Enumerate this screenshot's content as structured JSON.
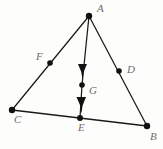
{
  "figure": {
    "kind": "geometry-diagram",
    "width": 163,
    "height": 149,
    "background_color": "#fdfdfc",
    "stroke_color": "#1a1a1a",
    "label_color": "#6d6d6d",
    "vertices": [
      {
        "id": "A",
        "label": "A",
        "x": 89,
        "y": 16,
        "dot": 3.2,
        "label_x": 97,
        "label_y": 3
      },
      {
        "id": "B",
        "label": "B",
        "x": 147,
        "y": 126,
        "dot": 3.2,
        "label_x": 150,
        "label_y": 131
      },
      {
        "id": "C",
        "label": "C",
        "x": 12,
        "y": 110,
        "dot": 3.2,
        "label_x": 14,
        "label_y": 114
      },
      {
        "id": "D",
        "label": "D",
        "x": 119,
        "y": 71,
        "dot": 2.8,
        "label_x": 127,
        "label_y": 64
      },
      {
        "id": "E",
        "label": "E",
        "x": 80,
        "y": 118,
        "dot": 3.0,
        "label_x": 78,
        "label_y": 122
      },
      {
        "id": "F",
        "label": "F",
        "x": 50,
        "y": 63,
        "dot": 2.8,
        "label_x": 36,
        "label_y": 51
      },
      {
        "id": "G",
        "label": "G",
        "x": 82,
        "y": 85,
        "dot": 2.8,
        "label_x": 89,
        "label_y": 85
      }
    ],
    "segments": [
      {
        "id": "AC",
        "from": "A",
        "to": "C",
        "through": "F"
      },
      {
        "id": "AB",
        "from": "A",
        "to": "B",
        "through": "D"
      },
      {
        "id": "CB",
        "from": "C",
        "to": "B",
        "through": "E"
      },
      {
        "id": "AE",
        "from": "A",
        "to": "E",
        "through": "G"
      }
    ],
    "arrow_marks": [
      {
        "id": "arrow-upper",
        "on": "AG",
        "tip_x": 82,
        "tip_y": 79,
        "base_y": 64,
        "half_width": 4.6
      },
      {
        "id": "arrow-lower",
        "on": "GE",
        "tip_x": 81,
        "tip_y": 113,
        "base_y": 97,
        "half_width": 4.8
      }
    ]
  }
}
